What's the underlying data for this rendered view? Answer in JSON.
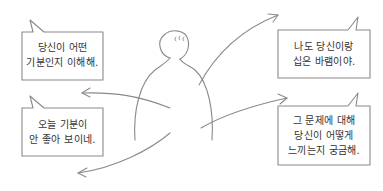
{
  "figure": {
    "label": "person",
    "stroke": "#8a8a8a"
  },
  "bubbles": [
    {
      "id": "top-left",
      "lines": [
        "당신이 어떤",
        "기분인지 이해해."
      ]
    },
    {
      "id": "top-right",
      "lines": [
        "나도 당신이랑",
        "십은 바램이야."
      ]
    },
    {
      "id": "bottom-left",
      "lines": [
        "오늘 기분이",
        "안 좋아 보이네."
      ]
    },
    {
      "id": "bottom-right",
      "lines": [
        "그 문제에 대해",
        "당신이 어떻게",
        "느끼는지 궁금해."
      ]
    }
  ],
  "colors": {
    "stroke": "#888888",
    "text": "#333333",
    "background": "#ffffff"
  }
}
